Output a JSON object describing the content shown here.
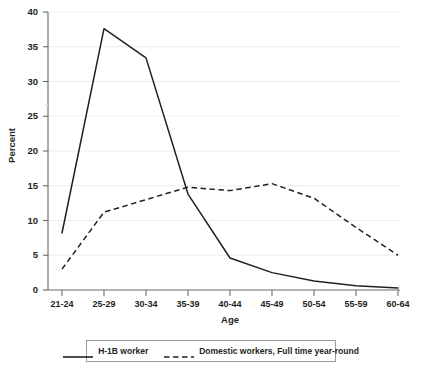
{
  "chart_data": {
    "type": "line",
    "title": "",
    "xlabel": "Age",
    "ylabel": "Percent",
    "categories": [
      "21-24",
      "25-29",
      "30-34",
      "35-39",
      "40-44",
      "45-49",
      "50-54",
      "55-59",
      "60-64"
    ],
    "ylim": [
      0,
      40
    ],
    "ytick_values": [
      0,
      5,
      10,
      15,
      20,
      25,
      30,
      35,
      40
    ],
    "ytick_labels": [
      "0",
      "5",
      "10",
      "15",
      "20",
      "25",
      "30",
      "35",
      "40"
    ],
    "grid": "horizontal",
    "legend_position": "bottom-center-boxed",
    "series": [
      {
        "name": "H-1B worker",
        "style": "solid",
        "color": "#231f20",
        "values": [
          8.2,
          37.6,
          33.4,
          13.8,
          4.6,
          2.5,
          1.3,
          0.6,
          0.3
        ]
      },
      {
        "name": "Domestic workers, Full time year-round",
        "style": "dashed",
        "color": "#231f20",
        "values": [
          3.0,
          11.2,
          13.0,
          14.8,
          14.3,
          15.3,
          13.2,
          9.0,
          5.0
        ]
      }
    ]
  },
  "axes": {
    "y_title": "Percent",
    "x_title": "Age"
  },
  "legend": {
    "entries": [
      {
        "label": "H-1B worker",
        "style": "solid"
      },
      {
        "label": "Domestic workers, Full time year-round",
        "style": "dashed"
      }
    ]
  },
  "caption": {
    "partial_text": ""
  },
  "colors": {
    "line": "#231f20",
    "grid": "#ededed",
    "axis": "#6b6b6b",
    "legend_border": "#9a9a9a",
    "background": "#ffffff"
  }
}
